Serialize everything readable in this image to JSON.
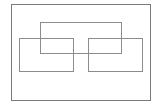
{
  "diagram": {
    "canvas": {
      "width": 158,
      "height": 104,
      "background": "#ffffff"
    },
    "shapes": [
      {
        "id": "outer-frame",
        "type": "rectangle",
        "x": 11,
        "y": 4,
        "width": 140,
        "height": 97,
        "stroke": "#7a7a7a"
      },
      {
        "id": "top-center-rect",
        "type": "rectangle",
        "x": 40,
        "y": 22,
        "width": 82,
        "height": 32,
        "stroke": "#8c8c8c"
      },
      {
        "id": "left-rect",
        "type": "rectangle",
        "x": 19,
        "y": 38,
        "width": 55,
        "height": 34,
        "stroke": "#8c8c8c"
      },
      {
        "id": "right-rect",
        "type": "rectangle",
        "x": 88,
        "y": 38,
        "width": 55,
        "height": 34,
        "stroke": "#8c8c8c"
      }
    ]
  }
}
